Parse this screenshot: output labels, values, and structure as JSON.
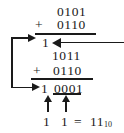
{
  "diagram": {
    "ink_color": "#1a1a1a",
    "background_color": "#ffffff"
  },
  "first_addition": {
    "operand_a": "0101",
    "operator": "+",
    "operand_b": "0110",
    "result_carry": "1"
  },
  "second_addition": {
    "operand_a": "1011",
    "operator": "+",
    "operand_b": "0110",
    "result_carry": "1",
    "result_digits": "0001"
  },
  "conclusion": {
    "digit_left": "1",
    "digit_right": "1",
    "equals": "=",
    "value": "11",
    "base_subscript": "10"
  },
  "annotations": {
    "feedback_arrow_label": "carry-feedback-loop",
    "incoming_arrow_label": "carry-in-arrow",
    "up_arrow_left_label": "pointer-to-carry-digit",
    "up_arrow_right_label": "pointer-to-sum-digits"
  }
}
